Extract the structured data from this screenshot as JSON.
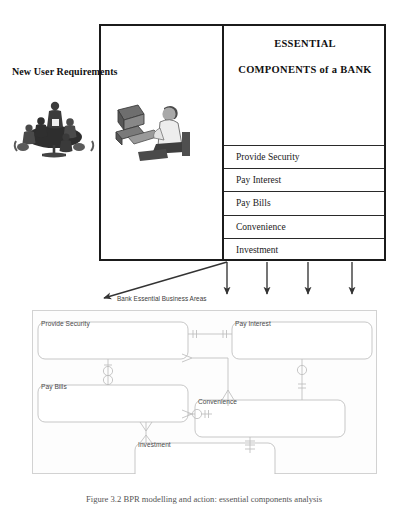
{
  "figure": {
    "left_label": "New User Requirements",
    "caption": "Figure 3.2 BPR modelling and action: essential components analysis"
  },
  "top_panel": {
    "heading_line1": "ESSENTIAL",
    "heading_line2": "COMPONENTS of a BANK",
    "components": [
      "Provide Security",
      "Pay Interest",
      "Pay Bills",
      "Convenience",
      "Investment"
    ]
  },
  "clipart": {
    "meeting": "meeting-table-clipart",
    "computer": "person-at-computer-clipart"
  },
  "er_panel": {
    "label": "Bank Essential Business Areas",
    "entities": [
      {
        "name": "Provide Security",
        "x": 6,
        "y": 12,
        "w": 150,
        "h": 37
      },
      {
        "name": "Pay Interest",
        "x": 200,
        "y": 12,
        "w": 140,
        "h": 37
      },
      {
        "name": "Pay Bills",
        "x": 6,
        "y": 75,
        "w": 150,
        "h": 37
      },
      {
        "name": "Convenience",
        "x": 163,
        "y": 90,
        "w": 150,
        "h": 37
      },
      {
        "name": "Investment",
        "x": 103,
        "y": 133,
        "w": 140,
        "h": 37
      }
    ]
  },
  "colors": {
    "frame_stroke": "#1b1b1b",
    "row_rule": "#2a2a2a",
    "er_stroke": "#bdbdbd",
    "er_text": "#4a4a4a",
    "panel_border": "#d2d2d2",
    "arrow": "#333333"
  },
  "arrows": {
    "vertical_count": 4,
    "diagonal_count": 1
  }
}
